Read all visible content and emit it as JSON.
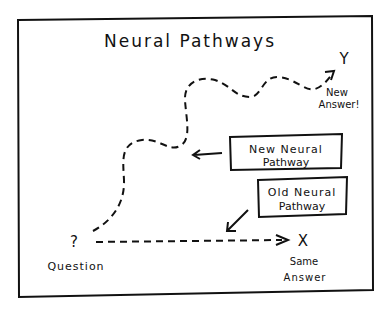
{
  "title": "Neural Pathways",
  "start": {
    "symbol": "?",
    "label": "Question"
  },
  "old_end": {
    "symbol": "X",
    "label_line1": "Same",
    "label_line2": "Answer"
  },
  "new_end": {
    "symbol": "Y",
    "label_line1": "New",
    "label_line2": "Answer!"
  },
  "callouts": [
    {
      "line1": "New Neural",
      "line2": "Pathway"
    },
    {
      "line1": "Old Neural",
      "line2": "Pathway"
    }
  ],
  "colors": {
    "ink": "#111111",
    "background": "#ffffff"
  }
}
